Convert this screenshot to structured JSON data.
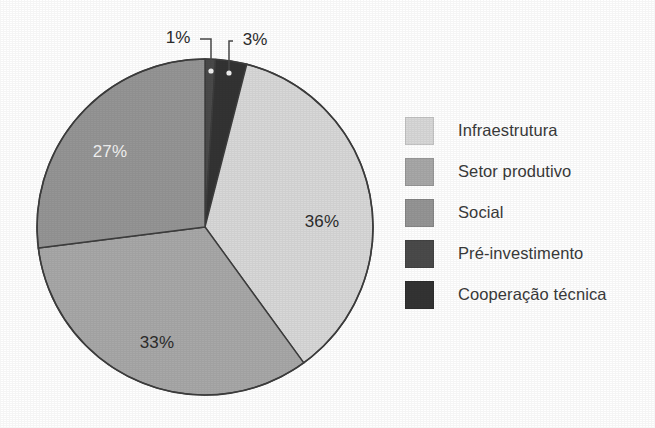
{
  "chart_data": {
    "type": "pie",
    "title": "",
    "subtitle": "",
    "xlabel": "",
    "ylabel": "",
    "grid": false,
    "legend_position": "right",
    "units": "percent",
    "total": 100,
    "start_angle_deg": 0,
    "direction": "clockwise",
    "categories": [
      "Pré-investimento",
      "Cooperação técnica",
      "Infraestrutura",
      "Setor produtivo",
      "Social"
    ],
    "values": [
      1,
      3,
      36,
      33,
      27
    ],
    "labels": [
      "1%",
      "3%",
      "36%",
      "33%",
      "27%"
    ],
    "slices": [
      {
        "name": "Pré-investimento",
        "value": 1,
        "label": "1%",
        "color": "#4a4a4a",
        "label_style": "callout",
        "label_color": "#2c2c2c",
        "label_x": 178,
        "label_y": 38,
        "leader_x": 211,
        "leader_y": 71
      },
      {
        "name": "Cooperação técnica",
        "value": 3,
        "label": "3%",
        "color": "#333333",
        "label_style": "callout",
        "label_color": "#2c2c2c",
        "label_x": 255,
        "label_y": 40,
        "leader_x": 229,
        "leader_y": 73
      },
      {
        "name": "Infraestrutura",
        "value": 36,
        "label": "36%",
        "color": "#d8d8d8",
        "label_style": "inside-dark",
        "label_color": "#2c2c2c",
        "label_x": 322,
        "label_y": 222
      },
      {
        "name": "Setor produtivo",
        "value": 33,
        "label": "33%",
        "color": "#a8a8a8",
        "label_style": "inside-dark",
        "label_color": "#2c2c2c",
        "label_x": 157,
        "label_y": 343
      },
      {
        "name": "Social",
        "value": 27,
        "label": "27%",
        "color": "#959595",
        "label_style": "inside-light",
        "label_color": "#f2f2f2",
        "label_x": 110,
        "label_y": 152
      }
    ],
    "legend": [
      {
        "label": "Infraestrutura",
        "color": "#d8d8d8"
      },
      {
        "label": "Setor produtivo",
        "color": "#a8a8a8"
      },
      {
        "label": "Social",
        "color": "#959595"
      },
      {
        "label": "Pré-investimento",
        "color": "#4a4a4a"
      },
      {
        "label": "Cooperação técnica",
        "color": "#333333"
      }
    ]
  },
  "geometry": {
    "center_x": 205,
    "center_y": 227,
    "radius": 168,
    "outline_color": "#3d3d3d"
  }
}
